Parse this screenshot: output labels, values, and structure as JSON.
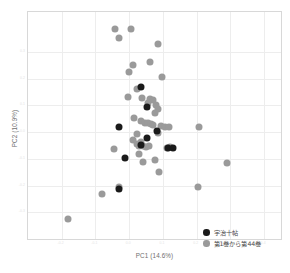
{
  "chart_data": {
    "type": "scatter",
    "title": "",
    "xlabel": "PC1 (14.6%)",
    "ylabel": "PC2 (10.9%)",
    "xlim": [
      -0.3,
      0.45
    ],
    "ylim": [
      -0.4,
      0.45
    ],
    "grid": true,
    "legend_position": "bottom-right",
    "xticks": [
      "-0.2",
      "-0.1",
      "0.0",
      "0.1",
      "0.2",
      "0.3",
      "0.4"
    ],
    "yticks": [
      "-0.3",
      "-0.2",
      "-0.1",
      "0.0",
      "0.1",
      "0.2",
      "0.3"
    ],
    "colors": {
      "uji": "#1a1a1a",
      "main": "#9a9a9a",
      "grid": "#ededed",
      "frame": "#d8d8d8",
      "axis_text": "#6f6f6f"
    },
    "series": [
      {
        "name": "宇治十帖",
        "color": "#1a1a1a",
        "marker": "circle",
        "points": [
          [
            0.034,
            0.17
          ],
          [
            0.052,
            0.095
          ],
          [
            -0.031,
            0.02
          ],
          [
            0.052,
            -0.02
          ],
          [
            0.083,
            0.003
          ],
          [
            0.034,
            -0.047
          ],
          [
            0.114,
            -0.058
          ],
          [
            0.129,
            -0.06
          ],
          [
            -0.012,
            -0.095
          ],
          [
            -0.031,
            -0.213
          ]
        ]
      },
      {
        "name": "第1巻から第44巻",
        "color": "#9a9a9a",
        "marker": "circle",
        "points": [
          [
            -0.043,
            0.385
          ],
          [
            0.006,
            0.385
          ],
          [
            -0.03,
            0.352
          ],
          [
            0.086,
            0.33
          ],
          [
            0.063,
            0.261
          ],
          [
            0.012,
            0.252
          ],
          [
            0.0,
            0.226
          ],
          [
            0.098,
            0.208
          ],
          [
            0.024,
            0.162
          ],
          [
            -0.005,
            0.131
          ],
          [
            0.037,
            0.128
          ],
          [
            0.062,
            0.126
          ],
          [
            0.07,
            0.122
          ],
          [
            0.057,
            0.11
          ],
          [
            0.079,
            0.103
          ],
          [
            0.086,
            0.086
          ],
          [
            0.076,
            0.07
          ],
          [
            0.013,
            0.052
          ],
          [
            0.036,
            0.04
          ],
          [
            0.047,
            0.035
          ],
          [
            0.056,
            0.033
          ],
          [
            0.064,
            0.03
          ],
          [
            0.072,
            0.028
          ],
          [
            0.094,
            0.022
          ],
          [
            0.107,
            0.02
          ],
          [
            0.118,
            0.018
          ],
          [
            0.207,
            0.02
          ],
          [
            0.086,
            -0.004
          ],
          [
            0.024,
            -0.008
          ],
          [
            0.011,
            -0.03
          ],
          [
            0.035,
            -0.038
          ],
          [
            0.022,
            -0.046
          ],
          [
            0.029,
            -0.05
          ],
          [
            0.041,
            -0.052
          ],
          [
            0.05,
            -0.054
          ],
          [
            0.058,
            -0.053
          ],
          [
            0.112,
            -0.058
          ],
          [
            0.122,
            -0.056
          ],
          [
            -0.045,
            -0.062
          ],
          [
            0.03,
            -0.081
          ],
          [
            0.042,
            -0.11
          ],
          [
            0.077,
            -0.106
          ],
          [
            0.088,
            -0.148
          ],
          [
            0.291,
            -0.116
          ],
          [
            -0.031,
            -0.205
          ],
          [
            -0.08,
            -0.231
          ],
          [
            0.205,
            -0.206
          ],
          [
            -0.182,
            -0.325
          ]
        ]
      }
    ]
  },
  "axes": {
    "x_title": "PC1 (14.6%)",
    "y_title": "PC2 (10.9%)"
  },
  "legend": {
    "items": [
      {
        "label": "宇治十帖",
        "color": "#1a1a1a"
      },
      {
        "label": "第1巻から第44巻",
        "color": "#9a9a9a"
      }
    ]
  }
}
